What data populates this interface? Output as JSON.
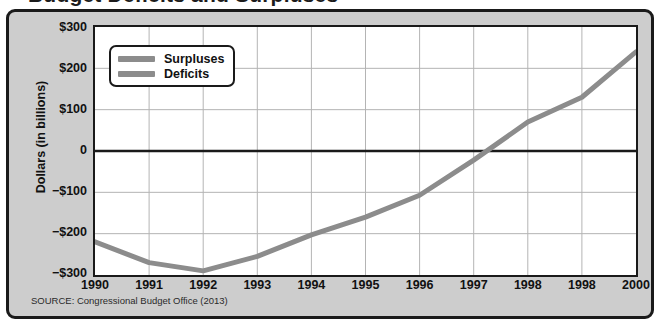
{
  "figure": {
    "title_partial": "Budget Deficits and Surpluses",
    "watermark_text": "CHAPTER 15",
    "source_note": "SOURCE: Congressional Budget Office (2013)",
    "border_color": "#1a1a1a",
    "panel_background": "#cdcdcd",
    "plot_background": "#ffffff"
  },
  "legend": {
    "position": "top-left-inside",
    "items": [
      {
        "label": "Surpluses",
        "color": "#8c8c8c",
        "swatch_name": "legend-swatch-surpluses"
      },
      {
        "label": "Deficits",
        "color": "#8c8c8c",
        "swatch_name": "legend-swatch-deficits"
      }
    ]
  },
  "chart_data": {
    "type": "line",
    "title": "Budget Deficits and Surpluses",
    "xlabel": "",
    "ylabel": "Dollars (in billions)",
    "x": [
      "1990",
      "1991",
      "1992",
      "1993",
      "1994",
      "1995",
      "1996",
      "1997",
      "1998",
      "1998",
      "2000"
    ],
    "x_tick_labels": [
      "1990",
      "1991",
      "1992",
      "1993",
      "1994",
      "1995",
      "1996",
      "1997",
      "1998",
      "1998",
      "2000"
    ],
    "y_tick_labels": [
      "$300",
      "$200",
      "$100",
      "0",
      "−$100",
      "−$200",
      "−$300"
    ],
    "y_tick_values": [
      300,
      200,
      100,
      0,
      -100,
      -200,
      -300
    ],
    "ylim": [
      -300,
      300
    ],
    "grid": true,
    "zero_line": true,
    "line_color": "#8c8c8c",
    "line_width": 5,
    "series": [
      {
        "name": "Deficits and Surpluses",
        "values": [
          -220,
          -270,
          -290,
          -255,
          -203,
          -160,
          -107,
          -22,
          70,
          130,
          240
        ]
      }
    ],
    "annotations": [
      "Line crosses zero between 1997 and 1998",
      "Second-to-last x tick label is printed as 1998 (duplicate, likely 1999)"
    ]
  },
  "axes": {
    "y_title": "Dollars (in billions)"
  }
}
